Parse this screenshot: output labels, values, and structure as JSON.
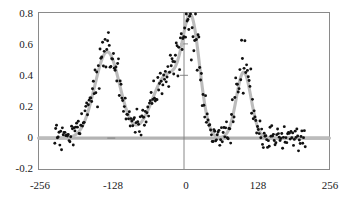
{
  "chart_data": {
    "type": "scatter",
    "title": "",
    "subtitle": "",
    "xlabel": "",
    "ylabel": "",
    "xlim": [
      -256,
      256
    ],
    "ylim": [
      -0.2,
      0.8
    ],
    "xticks": [
      -256,
      -128,
      0,
      128,
      256
    ],
    "xtick_labels": [
      "-256",
      "-128",
      "0",
      "128",
      "256"
    ],
    "yticks": [
      -0.2,
      0,
      0.2,
      0.4,
      0.6,
      0.8
    ],
    "ytick_labels": [
      "-0.2",
      "0",
      "0.2",
      "0.4",
      "0.6",
      "0.8"
    ],
    "grid": false,
    "legend": "none",
    "series": [
      {
        "name": "fitted curve",
        "type": "line",
        "color": "#bcbcbc",
        "description": "smooth gray fit through four gaussian peaks over a flat zero baseline"
      },
      {
        "name": "data points",
        "type": "scatter",
        "color": "#111111",
        "marker": "filled-circle",
        "n_points": 300,
        "x_range": [
          -228,
          214
        ],
        "noise_sigma": 0.045,
        "description": "black scattered samples following the fitted curve"
      }
    ],
    "peaks": [
      {
        "center": -135,
        "amplitude": 0.55,
        "width": 22
      },
      {
        "center": -30,
        "amplitude": 0.4,
        "width": 26
      },
      {
        "center": 13,
        "amplitude": 0.68,
        "width": 15
      },
      {
        "center": 105,
        "amplitude": 0.42,
        "width": 13
      }
    ],
    "baseline": 0.0,
    "reference_lines": [
      {
        "axis": "y",
        "value": 0,
        "color": "#b3b3b3",
        "width": 3.2
      },
      {
        "axis": "x",
        "value": 0,
        "color": "#7a7a7a",
        "width": 0.9
      }
    ],
    "minor_ticks": [
      {
        "x": 0,
        "y": 0.6
      },
      {
        "x": 0,
        "y": 0.4
      },
      {
        "x": -128,
        "y": 0
      }
    ]
  },
  "axes": {
    "y_labels": [
      "0.8",
      "0.6",
      "0.4",
      "0.2",
      "0",
      "-0.2"
    ],
    "x_labels": [
      "-256",
      "-128",
      "0",
      "128",
      "256"
    ]
  },
  "colors": {
    "frame": "#8a8a8a",
    "point": "#111111",
    "curve": "#bcbcbc",
    "zero_line": "#b3b3b3",
    "axis_line": "#7a7a7a",
    "background": "#ffffff",
    "text": "#1a1a1a"
  }
}
